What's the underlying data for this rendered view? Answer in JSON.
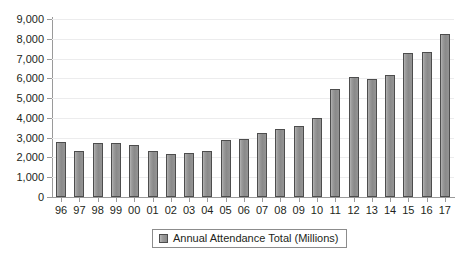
{
  "chart_data": {
    "type": "bar",
    "title": "",
    "subtitle": "",
    "xlabel": "",
    "ylabel": "",
    "ylim": [
      0,
      9000
    ],
    "ytick_step": 1000,
    "grid": true,
    "legend_position": "bottom-center",
    "categories": [
      "96",
      "97",
      "98",
      "99",
      "00",
      "01",
      "02",
      "03",
      "04",
      "05",
      "06",
      "07",
      "08",
      "09",
      "10",
      "11",
      "12",
      "13",
      "14",
      "15",
      "16",
      "17"
    ],
    "series": [
      {
        "name": "Annual Attendance Total (Millions)",
        "color": "#8c8c8c",
        "values": [
          2790,
          2320,
          2740,
          2750,
          2630,
          2350,
          2200,
          2210,
          2310,
          2890,
          2950,
          3250,
          3450,
          3600,
          4000,
          5450,
          6060,
          5990,
          6150,
          7300,
          7350,
          8230
        ]
      }
    ],
    "ytick_labels": [
      "0",
      "1,000",
      "2,000",
      "3,000",
      "4,000",
      "5,000",
      "6,000",
      "7,000",
      "8,000",
      "9,000"
    ],
    "ytick_values": [
      0,
      1000,
      2000,
      3000,
      4000,
      5000,
      6000,
      7000,
      8000,
      9000
    ]
  },
  "legend": {
    "items": [
      {
        "label": "Annual Attendance Total (Millions)",
        "swatch_color": "#8c8c8c"
      }
    ]
  },
  "colors": {
    "bar_fill": "#8c8c8c",
    "bar_stroke": "#4d4d4d",
    "axis": "#9a9a9a",
    "grid": "#ececed",
    "text": "#231f20",
    "background": "#ffffff"
  }
}
